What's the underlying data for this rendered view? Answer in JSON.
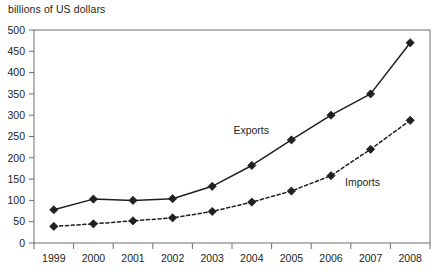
{
  "chart_data": {
    "type": "line",
    "title": "billions of US dollars",
    "xlabel": "",
    "ylabel": "billions of US dollars",
    "categories": [
      "1999",
      "2000",
      "2001",
      "2002",
      "2003",
      "2004",
      "2005",
      "2006",
      "2007",
      "2008"
    ],
    "x": [
      1999,
      2000,
      2001,
      2002,
      2003,
      2004,
      2005,
      2006,
      2007,
      2008
    ],
    "series": [
      {
        "name": "Exports",
        "style": "solid",
        "marker": "filled-diamond",
        "color": "#231f20",
        "values": [
          78,
          103,
          100,
          104,
          133,
          182,
          242,
          300,
          350,
          470
        ]
      },
      {
        "name": "Imports",
        "style": "dashed",
        "marker": "filled-diamond",
        "color": "#231f20",
        "values": [
          39,
          45,
          52,
          59,
          74,
          96,
          122,
          158,
          220,
          288
        ]
      }
    ],
    "ylim": [
      0,
      500
    ],
    "yticks": [
      0,
      50,
      100,
      150,
      200,
      250,
      300,
      350,
      400,
      450,
      500
    ],
    "ytick_labels": [
      "0",
      "50",
      "100",
      "150",
      "200",
      "250",
      "300",
      "350",
      "400",
      "450",
      "500"
    ],
    "grid": false,
    "legend": "inline-annotation",
    "annotations": [
      {
        "text": "Exports",
        "series": "Exports"
      },
      {
        "text": "Imports",
        "series": "Imports"
      }
    ]
  }
}
